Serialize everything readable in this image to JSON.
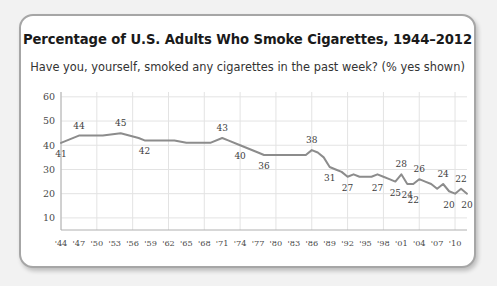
{
  "card": {
    "title": "Percentage of U.S. Adults Who Smoke Cigarettes, 1944–2012",
    "subtitle": "Have you, yourself, smoked any cigarettes in the past week? (% yes shown)"
  },
  "colors": {
    "line": "#8c8c8c",
    "grid": "#e3e3e3",
    "axis": "#b0b0b0",
    "card_border": "#a6a6a6",
    "text": "#1a1a1a",
    "page_bg": "#f2f2f2",
    "card_bg": "#ffffff"
  },
  "chart_data": {
    "type": "line",
    "title": "Percentage of U.S. Adults Who Smoke Cigarettes, 1944–2012",
    "subtitle": "Have you, yourself, smoked any cigarettes in the past week? (% yes shown)",
    "xlabel": "",
    "ylabel": "",
    "ylim": [
      5,
      62
    ],
    "yticks": [
      10,
      20,
      30,
      40,
      50,
      60
    ],
    "ytick_labels": [
      "10",
      "20",
      "30",
      "40",
      "50",
      "60"
    ],
    "xlim": [
      1944,
      2012
    ],
    "xticks": [
      1944,
      1947,
      1950,
      1953,
      1956,
      1959,
      1962,
      1965,
      1968,
      1971,
      1974,
      1977,
      1980,
      1983,
      1986,
      1989,
      1992,
      1995,
      1998,
      2001,
      2004,
      2007,
      2010
    ],
    "xtick_labels": [
      "'44",
      "'47",
      "'50",
      "'53",
      "'56",
      "'59",
      "'62",
      "'65",
      "'68",
      "'71",
      "'74",
      "'77",
      "'80",
      "'83",
      "'86",
      "'89",
      "'92",
      "'95",
      "'98",
      "'01",
      "'04",
      "'07",
      "'10"
    ],
    "grid": true,
    "legend": false,
    "x": [
      1944,
      1947,
      1949,
      1951,
      1954,
      1957,
      1958,
      1960,
      1963,
      1965,
      1967,
      1969,
      1971,
      1972,
      1974,
      1977,
      1978,
      1981,
      1983,
      1985,
      1986,
      1987,
      1988,
      1989,
      1990,
      1991,
      1992,
      1993,
      1994,
      1995,
      1996,
      1997,
      1998,
      1999,
      2000,
      2001,
      2002,
      2003,
      2004,
      2005,
      2006,
      2007,
      2008,
      2009,
      2010,
      2011,
      2012
    ],
    "values": [
      41,
      44,
      44,
      44,
      45,
      43,
      42,
      42,
      42,
      41,
      41,
      41,
      43,
      42,
      40,
      37,
      36,
      36,
      36,
      36,
      38,
      37,
      35,
      31,
      30,
      29,
      27,
      28,
      27,
      27,
      27,
      28,
      27,
      26,
      25,
      28,
      24,
      24,
      26,
      25,
      24,
      22,
      24,
      21,
      20,
      22,
      20
    ],
    "value_labels": [
      {
        "year": 1944,
        "value": 41,
        "text": "41",
        "side": "below"
      },
      {
        "year": 1947,
        "value": 44,
        "text": "44",
        "side": "above"
      },
      {
        "year": 1954,
        "value": 45,
        "text": "45",
        "side": "above"
      },
      {
        "year": 1958,
        "value": 42,
        "text": "42",
        "side": "below"
      },
      {
        "year": 1974,
        "value": 40,
        "text": "40",
        "side": "below"
      },
      {
        "year": 1971,
        "value": 43,
        "text": "43",
        "side": "above"
      },
      {
        "year": 1978,
        "value": 36,
        "text": "36",
        "side": "below"
      },
      {
        "year": 1986,
        "value": 38,
        "text": "38",
        "side": "above"
      },
      {
        "year": 1989,
        "value": 31,
        "text": "31",
        "side": "below"
      },
      {
        "year": 1992,
        "value": 27,
        "text": "27",
        "side": "below"
      },
      {
        "year": 1997,
        "value": 27,
        "text": "27",
        "side": "below"
      },
      {
        "year": 2000,
        "value": 25,
        "text": "25",
        "side": "below"
      },
      {
        "year": 2001,
        "value": 28,
        "text": "28",
        "side": "above"
      },
      {
        "year": 2002,
        "value": 24,
        "text": "24",
        "side": "below"
      },
      {
        "year": 2004,
        "value": 26,
        "text": "26",
        "side": "above"
      },
      {
        "year": 2003,
        "value": 22,
        "text": "22",
        "side": "below"
      },
      {
        "year": 2008,
        "value": 24,
        "text": "24",
        "side": "above"
      },
      {
        "year": 2009,
        "value": 20,
        "text": "20",
        "side": "below"
      },
      {
        "year": 2011,
        "value": 22,
        "text": "22",
        "side": "above"
      },
      {
        "year": 2012,
        "value": 20,
        "text": "20",
        "side": "below"
      }
    ]
  }
}
